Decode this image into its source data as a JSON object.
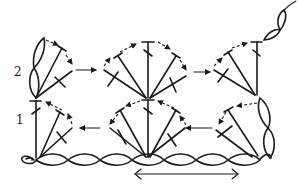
{
  "diagram": {
    "type": "crochet-stitch-chart",
    "row_labels": [
      {
        "label": "2",
        "x": 14,
        "y": 66
      },
      {
        "label": "1",
        "x": 16,
        "y": 114
      }
    ],
    "stroke_color": "#1a1a1a",
    "background": "#ffffff",
    "foundation_chain": {
      "count": 9,
      "y": 160,
      "x_start": 22,
      "x_end": 270
    },
    "repeat_arrow": {
      "x_start": 135,
      "x_end": 238,
      "y": 174
    },
    "rows": [
      {
        "row": 1,
        "direction": "right-to-left",
        "shells": [
          {
            "base_x": 258,
            "stitches": 3,
            "half": "left"
          },
          {
            "base_x": 148,
            "stitches": 5,
            "half": "full"
          },
          {
            "base_x": 38,
            "stitches": 3,
            "half": "right"
          }
        ]
      },
      {
        "row": 2,
        "direction": "left-to-right",
        "shells": [
          {
            "base_x": 35,
            "stitches": 3,
            "half": "right"
          },
          {
            "base_x": 148,
            "stitches": 5,
            "half": "full"
          },
          {
            "base_x": 258,
            "stitches": 3,
            "half": "left"
          }
        ]
      }
    ]
  }
}
